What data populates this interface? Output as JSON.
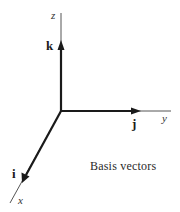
{
  "figure": {
    "caption": "Basis vectors",
    "axes": {
      "z": {
        "label": "z"
      },
      "y": {
        "label": "y"
      },
      "x": {
        "label": "x"
      }
    },
    "vectors": {
      "k": {
        "label": "k",
        "axis": "z"
      },
      "j": {
        "label": "j",
        "axis": "y"
      },
      "i": {
        "label": "i",
        "axis": "x"
      }
    },
    "colors": {
      "axis_line": "#555555",
      "vector": "#1a1a1a",
      "background": "#ffffff"
    }
  }
}
